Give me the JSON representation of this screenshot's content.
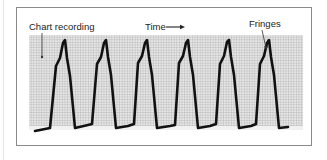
{
  "figure": {
    "labels": {
      "chart_recording": "Chart recording",
      "time": "Time",
      "fringes": "Fringes"
    },
    "colors": {
      "frame_border": "#8a8a8a",
      "grid_background": "#d8d8d8",
      "grid_line": "#9a9a9a",
      "trace": "#111111",
      "text": "#222222"
    },
    "waveform": {
      "cycles": 7,
      "peak_x": [
        63,
        104,
        146,
        187,
        227,
        268,
        309
      ],
      "description": "Periodic interference fringe trace recorded against time on a gridded chart"
    }
  }
}
